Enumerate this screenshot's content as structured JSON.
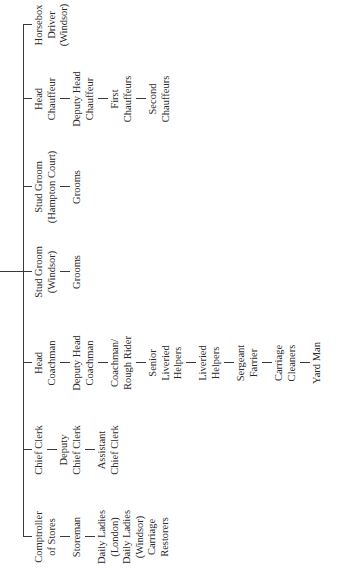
{
  "chart": {
    "title": "",
    "branches": [
      {
        "key": "stores",
        "head": [
          "Comptroller",
          "of Stores"
        ],
        "children": [
          [
            "Storeman"
          ],
          [
            "Daily Ladies",
            "(London)",
            "Daily Ladies",
            "(Windsor)",
            "Carriage",
            "Restorers"
          ]
        ]
      },
      {
        "key": "clerks",
        "head": [
          "Chief Clerk"
        ],
        "children": [
          [
            "Deputy",
            "Chief Clerk"
          ],
          [
            "Assistant",
            "Chief Clerk"
          ]
        ]
      },
      {
        "key": "coachmen",
        "head": [
          "Head",
          "Coachman"
        ],
        "children": [
          [
            "Deputy Head",
            "Coachman"
          ],
          [
            "Coachman/",
            "Rough Rider"
          ],
          [
            "Senior",
            "Liveried",
            "Helpers"
          ],
          [
            "Liveried",
            "Helpers"
          ],
          [
            "Sergeant",
            "Farrier"
          ],
          [
            "Carriage",
            "Cleaners"
          ],
          [
            "Yard Man"
          ]
        ]
      },
      {
        "key": "stud-windsor",
        "head": [
          "Stud Groom",
          "(Windsor)"
        ],
        "children": [
          [
            "Grooms"
          ]
        ]
      },
      {
        "key": "stud-hampton",
        "head": [
          "Stud Groom",
          "(Hampton Court)"
        ],
        "children": [
          [
            "Grooms"
          ]
        ]
      },
      {
        "key": "chauffeurs",
        "head": [
          "Head",
          "Chauffeur"
        ],
        "children": [
          [
            "Deputy Head",
            "Chauffeur"
          ],
          [
            "First",
            "Chauffeurs"
          ],
          [
            "Second",
            "Chauffeurs"
          ]
        ]
      },
      {
        "key": "horsebox",
        "head": [
          "Horsebox",
          "Driver",
          "(Windsor)"
        ],
        "children": []
      }
    ]
  }
}
